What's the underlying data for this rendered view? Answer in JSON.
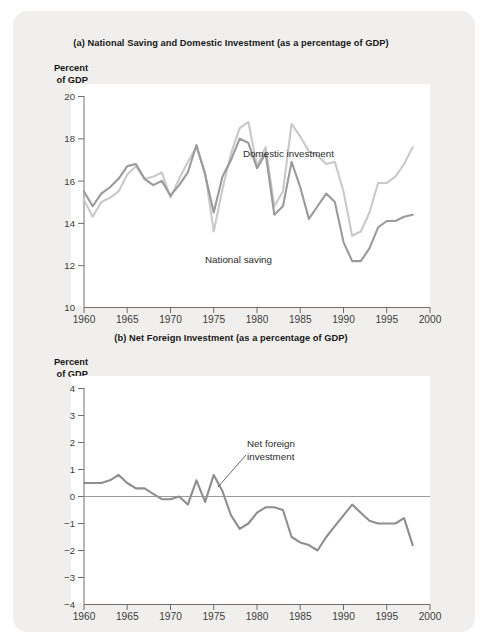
{
  "charts": {
    "a": {
      "title": "(a) National Saving and Domestic Investment (as a percentage of GDP)",
      "axis_caption_line1": "Percent",
      "axis_caption_line2": "of GDP",
      "label_domestic": "Domestic investment",
      "label_national": "National saving"
    },
    "b": {
      "title": "(b) Net Foreign Investment (as a percentage of GDP)",
      "axis_caption_line1": "Percent",
      "axis_caption_line2": "of GDP",
      "annotation_line1": "Net foreign",
      "annotation_line2": "investment"
    }
  },
  "chart_data": [
    {
      "type": "line",
      "id": "a",
      "title": "(a) National Saving and Domestic Investment (as a percentage of GDP)",
      "xlabel": "",
      "ylabel": "Percent of GDP",
      "xlim": [
        1960,
        2000
      ],
      "ylim": [
        10,
        20
      ],
      "xticks": [
        1960,
        1965,
        1970,
        1975,
        1980,
        1985,
        1990,
        1995,
        2000
      ],
      "yticks": [
        10,
        12,
        14,
        16,
        18,
        20
      ],
      "grid": false,
      "legend_position": "inline-annotation",
      "colors": {
        "domestic_investment": "#c9c9c9",
        "national_saving": "#9a9a9a"
      },
      "x": [
        1960,
        1961,
        1962,
        1963,
        1964,
        1965,
        1966,
        1967,
        1968,
        1969,
        1970,
        1971,
        1972,
        1973,
        1974,
        1975,
        1976,
        1977,
        1978,
        1979,
        1980,
        1981,
        1982,
        1983,
        1984,
        1985,
        1986,
        1987,
        1988,
        1989,
        1990,
        1991,
        1992,
        1993,
        1994,
        1995,
        1996,
        1997,
        1998
      ],
      "series": [
        {
          "name": "Domestic investment",
          "values": [
            15.1,
            14.3,
            15.0,
            15.2,
            15.5,
            16.3,
            16.7,
            16.1,
            16.2,
            16.4,
            15.2,
            16.1,
            16.9,
            17.6,
            16.4,
            13.6,
            15.6,
            17.3,
            18.5,
            18.8,
            16.7,
            17.6,
            14.8,
            15.5,
            18.7,
            18.1,
            17.4,
            17.2,
            16.8,
            16.9,
            15.5,
            13.4,
            13.6,
            14.5,
            15.9,
            15.9,
            16.2,
            16.8,
            17.6
          ]
        },
        {
          "name": "National saving",
          "values": [
            15.5,
            14.8,
            15.4,
            15.7,
            16.1,
            16.7,
            16.8,
            16.1,
            15.8,
            16.0,
            15.3,
            15.8,
            16.4,
            17.7,
            16.3,
            14.5,
            16.2,
            17.0,
            18.0,
            17.8,
            16.6,
            17.3,
            14.4,
            14.8,
            16.9,
            15.7,
            14.2,
            14.8,
            15.4,
            15.0,
            13.1,
            12.2,
            12.2,
            12.8,
            13.8,
            14.1,
            14.1,
            14.3,
            14.4
          ]
        }
      ]
    },
    {
      "type": "line",
      "id": "b",
      "title": "(b) Net Foreign Investment (as a percentage of GDP)",
      "xlabel": "",
      "ylabel": "Percent of GDP",
      "xlim": [
        1960,
        2000
      ],
      "ylim": [
        -4,
        4
      ],
      "xticks": [
        1960,
        1965,
        1970,
        1975,
        1980,
        1985,
        1990,
        1995,
        2000
      ],
      "yticks": [
        -4,
        -3,
        -2,
        -1,
        0,
        1,
        2,
        3,
        4
      ],
      "ytick_labels": [
        "−4",
        "−3",
        "−2",
        "−1",
        "0",
        "1",
        "2",
        "3",
        "4"
      ],
      "grid": false,
      "zero_line": true,
      "annotation": "Net foreign investment",
      "colors": {
        "net_foreign_investment": "#8e8e8e"
      },
      "x": [
        1960,
        1961,
        1962,
        1963,
        1964,
        1965,
        1966,
        1967,
        1968,
        1969,
        1970,
        1971,
        1972,
        1973,
        1974,
        1975,
        1976,
        1977,
        1978,
        1979,
        1980,
        1981,
        1982,
        1983,
        1984,
        1985,
        1986,
        1987,
        1988,
        1989,
        1990,
        1991,
        1992,
        1993,
        1994,
        1995,
        1996,
        1997,
        1998
      ],
      "series": [
        {
          "name": "Net foreign investment",
          "values": [
            0.5,
            0.5,
            0.5,
            0.6,
            0.8,
            0.5,
            0.3,
            0.3,
            0.1,
            -0.1,
            -0.1,
            0.0,
            -0.3,
            0.6,
            -0.2,
            0.8,
            0.2,
            -0.7,
            -1.2,
            -1.0,
            -0.6,
            -0.4,
            -0.4,
            -0.5,
            -1.5,
            -1.7,
            -1.8,
            -2.0,
            -1.5,
            -1.1,
            -0.7,
            -0.3,
            -0.6,
            -0.9,
            -1.0,
            -1.0,
            -1.0,
            -0.8,
            -1.8
          ]
        }
      ]
    }
  ]
}
